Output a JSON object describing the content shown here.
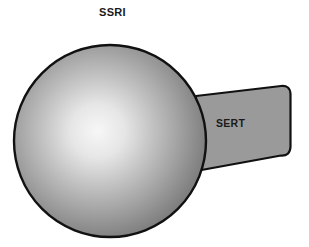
{
  "figure": {
    "background_color": "#ffffff",
    "width": 309,
    "height": 247,
    "labels": {
      "ssri": "SSRI",
      "sert": "SERT"
    },
    "shapes": {
      "sphere": {
        "name": "ssri-molecule-sphere",
        "shape": "circle",
        "center_x": 110,
        "center_y": 141,
        "radius": 97,
        "outline_color": "#111111",
        "outline_width": 2.2,
        "gradient": {
          "type": "radial",
          "highlight_x": 95,
          "highlight_y": 131,
          "stops": [
            {
              "offset": 0.0,
              "color": "#f7f7f7"
            },
            {
              "offset": 0.22,
              "color": "#e2e2e2"
            },
            {
              "offset": 0.48,
              "color": "#b4b4b4"
            },
            {
              "offset": 0.72,
              "color": "#8d8d8d"
            },
            {
              "offset": 0.9,
              "color": "#6f6f6f"
            },
            {
              "offset": 1.0,
              "color": "#5e5e5e"
            }
          ]
        }
      },
      "transporter": {
        "name": "sert-transporter-body",
        "shape": "rounded-trapezoid",
        "fill_color": "#9a9a9a",
        "outline_color": "#111111",
        "outline_width": 2.2,
        "left_x": 196,
        "right_x": 290,
        "top_left_y": 96,
        "top_right_y": 86,
        "bottom_left_y": 171,
        "bottom_right_y": 155,
        "corner_radius": 9
      }
    }
  }
}
